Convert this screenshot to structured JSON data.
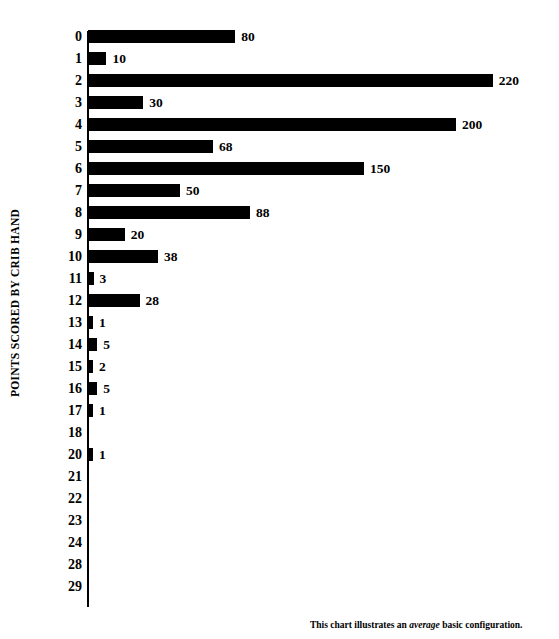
{
  "chart_data": {
    "type": "bar",
    "orientation": "horizontal",
    "title": "",
    "xlabel": "",
    "ylabel": "POINTS SCORED BY CRIB HAND",
    "categories": [
      "0",
      "1",
      "2",
      "3",
      "4",
      "5",
      "6",
      "7",
      "8",
      "9",
      "10",
      "11",
      "12",
      "13",
      "14",
      "15",
      "16",
      "17",
      "18",
      "20",
      "21",
      "22",
      "23",
      "24",
      "28",
      "29"
    ],
    "values": [
      80,
      10,
      220,
      30,
      200,
      68,
      150,
      50,
      88,
      20,
      38,
      3,
      28,
      1,
      5,
      2,
      5,
      1,
      null,
      1,
      null,
      null,
      null,
      null,
      null,
      null
    ],
    "value_labels": [
      "80",
      "10",
      "220",
      "30",
      "200",
      "68",
      "150",
      "50",
      "88",
      "20",
      "38",
      "3",
      "28",
      "1",
      "5",
      "2",
      "5",
      "1",
      "",
      "1",
      "",
      "",
      "",
      "",
      "",
      ""
    ],
    "xlim": [
      0,
      220
    ],
    "grid": false,
    "legend": false,
    "bar_color": "#000000",
    "background_color": "#ffffff"
  },
  "axis": {
    "y_title": "POINTS SCORED BY CRIB HAND"
  },
  "footnote": {
    "prefix": "This chart illustrates an ",
    "emphasis": "average",
    "suffix": " basic configuration."
  }
}
